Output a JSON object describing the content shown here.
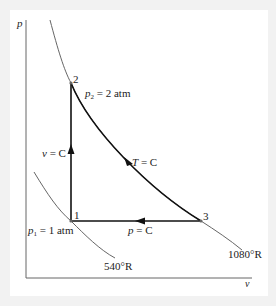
{
  "diagram": {
    "type": "p-v diagram",
    "axes": {
      "y_label": "p",
      "x_label": "v"
    },
    "points": [
      {
        "id": "1",
        "label": "1",
        "state": "p1 = 1 atm"
      },
      {
        "id": "2",
        "label": "2",
        "state": "p2 = 2 atm"
      },
      {
        "id": "3",
        "label": "3"
      }
    ],
    "processes": [
      {
        "from": "1",
        "to": "2",
        "label_var": "v",
        "label_rest": " = C",
        "kind": "constant volume"
      },
      {
        "from": "2",
        "to": "3",
        "label_var": "T",
        "label_rest": " = C",
        "kind": "isothermal"
      },
      {
        "from": "3",
        "to": "1",
        "label_var": "p",
        "label_rest": " = C",
        "kind": "constant pressure"
      }
    ],
    "isotherms": [
      {
        "label": "540°R"
      },
      {
        "label": "1080°R"
      }
    ],
    "annotations": {
      "p1_var": "p",
      "p1_sub": "1",
      "p1_rest": " = 1 atm",
      "p2_var": "p",
      "p2_sub": "2",
      "p2_rest": " = 2 atm"
    },
    "colors": {
      "process_line": "#111111",
      "isotherm_line": "#555555",
      "axis": "#666666",
      "background": "#ffffff",
      "outer": "#f2f2f2"
    }
  }
}
